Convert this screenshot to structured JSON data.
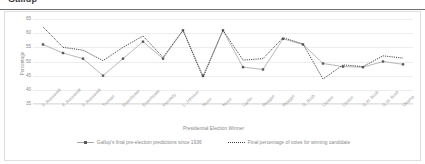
{
  "top_crop": {
    "ghost_title": "Gallup"
  },
  "chart_data": {
    "type": "line",
    "title": "",
    "xlabel": "Presidential Election Winner",
    "ylabel": "Percentage",
    "ylim": [
      35,
      65
    ],
    "yticks": [
      65,
      60,
      55,
      50,
      45,
      40,
      35
    ],
    "grid": true,
    "legend_position": "bottom",
    "categories": [
      "F. Roosevelt",
      "F. Roosevelt",
      "F. Roosevelt",
      "Truman",
      "Eisenhower",
      "Eisenhower",
      "Kennedy",
      "L. Johnson",
      "Nixon",
      "Nixon",
      "Carter",
      "Reagan",
      "Reagan",
      "G. Bush",
      "Clinton",
      "Clinton",
      "G.W. Bush",
      "G.W. Bush",
      "Obama"
    ],
    "series": [
      {
        "name": "Gallup's final pre-election predictions since 1936",
        "style": "solid-marker",
        "color": "#a6a6a6",
        "marker_color": "#595959",
        "values": [
          56.0,
          53.0,
          51.0,
          45.0,
          51.0,
          57.0,
          51.0,
          61.0,
          45.0,
          61.0,
          48.0,
          47.2,
          58.0,
          56.0,
          49.3,
          48.2,
          48.0,
          50.0,
          49.0
        ]
      },
      {
        "name": "Final percentage of votes for winning candidate",
        "style": "dotted",
        "color": "#404040",
        "values": [
          62.2,
          55.0,
          54.0,
          50.3,
          55.0,
          59.0,
          51.5,
          61.0,
          44.3,
          61.0,
          50.5,
          51.0,
          58.4,
          56.2,
          43.8,
          48.8,
          48.2,
          52.0,
          51.2
        ]
      }
    ]
  },
  "legend": [
    {
      "label": "Gallup's final pre-election predictions since 1936",
      "marker": "solid-square-marker-line"
    },
    {
      "label": "Final percentage of votes for winning candidate",
      "marker": "dotted-line"
    }
  ]
}
